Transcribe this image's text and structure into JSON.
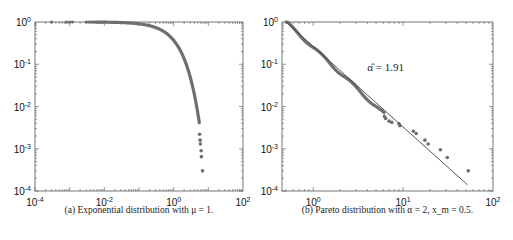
{
  "chart_data": [
    {
      "type": "scatter",
      "id": "exponential",
      "caption": "(a) Exponential distribution with μ = 1.",
      "xscale": "log",
      "yscale": "log",
      "xlim": [
        0.0001,
        100
      ],
      "ylim": [
        0.0001,
        1
      ],
      "xticks": [
        {
          "v": 0.0001,
          "b": "10",
          "e": "-4"
        },
        {
          "v": 0.01,
          "b": "10",
          "e": "-2"
        },
        {
          "v": 1,
          "b": "10",
          "e": "0"
        },
        {
          "v": 100,
          "b": "10",
          "e": "2"
        }
      ],
      "yticks": [
        {
          "v": 1,
          "b": "10",
          "e": "0"
        },
        {
          "v": 0.1,
          "b": "10",
          "e": "-1"
        },
        {
          "v": 0.01,
          "b": "10",
          "e": "-2"
        },
        {
          "v": 0.001,
          "b": "10",
          "e": "-3"
        },
        {
          "v": 0.0001,
          "b": "10",
          "e": "-4"
        }
      ],
      "series": [
        {
          "name": "empirical CCDF",
          "kind": "exp-ccdf",
          "mu": 1,
          "sparse_points": [
            [
              0.0003,
              1
            ],
            [
              0.0008,
              1
            ],
            [
              0.001,
              1
            ],
            [
              0.0012,
              1
            ],
            [
              0.003,
              1
            ],
            [
              0.0035,
              1
            ],
            [
              0.004,
              1
            ],
            [
              0.0045,
              1
            ],
            [
              0.005,
              1
            ],
            [
              0.0055,
              1
            ],
            [
              0.006,
              1
            ]
          ],
          "tail_points": [
            [
              5.6,
              0.0022
            ],
            [
              5.8,
              0.0016
            ],
            [
              5.9,
              0.0013
            ],
            [
              6.2,
              0.0009
            ],
            [
              6.3,
              0.00065
            ],
            [
              6.8,
              0.0003
            ]
          ]
        }
      ],
      "color": "#6e6e6e"
    },
    {
      "type": "scatter",
      "id": "pareto",
      "caption": "(b) Pareto distribution with α = 2, x_m = 0.5.",
      "xscale": "log",
      "yscale": "log",
      "xlim": [
        0.45,
        100
      ],
      "ylim": [
        0.0001,
        1
      ],
      "xticks": [
        {
          "v": 1,
          "b": "10",
          "e": "0"
        },
        {
          "v": 10,
          "b": "10",
          "e": "1"
        },
        {
          "v": 100,
          "b": "10",
          "e": "2"
        }
      ],
      "yticks": [
        {
          "v": 1,
          "b": "10",
          "e": "0"
        },
        {
          "v": 0.1,
          "b": "10",
          "e": "-1"
        },
        {
          "v": 0.01,
          "b": "10",
          "e": "-2"
        },
        {
          "v": 0.001,
          "b": "10",
          "e": "-3"
        },
        {
          "v": 0.0001,
          "b": "10",
          "e": "-4"
        }
      ],
      "annotation": {
        "text": "α̂ = 1.91",
        "x": 4.0,
        "y": 0.07
      },
      "fit_line": {
        "alpha_hat": 1.91,
        "xm": 0.5,
        "x_range": [
          0.5,
          52
        ]
      },
      "series": [
        {
          "name": "empirical CCDF",
          "kind": "pareto-ccdf",
          "alpha": 2,
          "xm": 0.5,
          "tail_points": [
            [
              6.2,
              0.0058
            ],
            [
              6.4,
              0.0052
            ],
            [
              7,
              0.0045
            ],
            [
              7.5,
              0.0042
            ],
            [
              9,
              0.0039
            ],
            [
              9.2,
              0.0035
            ],
            [
              13,
              0.0026
            ],
            [
              14,
              0.0023
            ],
            [
              17.5,
              0.0016
            ],
            [
              19,
              0.0013
            ],
            [
              26,
              0.00095
            ],
            [
              31,
              0.00062
            ],
            [
              53,
              0.0003
            ]
          ]
        }
      ],
      "color": "#6e6e6e"
    }
  ]
}
